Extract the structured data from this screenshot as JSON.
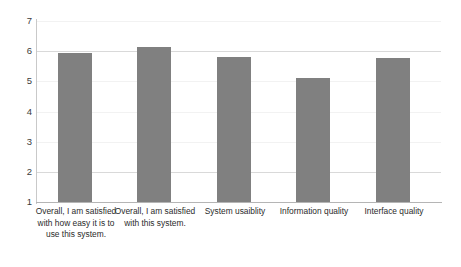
{
  "chart_data": {
    "type": "bar",
    "title": "",
    "subtitle": "",
    "xlabel": "",
    "ylabel": "",
    "ylim": [
      1,
      7
    ],
    "ytick_labels": [
      "7",
      "6",
      "5",
      "4",
      "3",
      "2",
      "1"
    ],
    "ytick_values": [
      7,
      6,
      5,
      4,
      3,
      2,
      1
    ],
    "grid": true,
    "grid_axis": "y",
    "legend": false,
    "bar_color": "#808080",
    "gridline_color": "#d9d9d9",
    "axis_color": "#b5b5b5",
    "categories": [
      "Overall, I am satisfied with how easy it is to use this system.",
      "Overall, I am satisfied with this system.",
      "System usaiblity",
      "Information quality",
      "Interface quality"
    ],
    "values": [
      5.93,
      6.13,
      5.8,
      5.12,
      5.77
    ],
    "series": [
      {
        "name": "",
        "values": [
          5.93,
          6.13,
          5.8,
          5.12,
          5.77
        ]
      }
    ]
  },
  "axes": {
    "y_ticks": [
      {
        "label": "7",
        "value": 7
      },
      {
        "label": "6",
        "value": 6
      },
      {
        "label": "5",
        "value": 5
      },
      {
        "label": "4",
        "value": 4
      },
      {
        "label": "3",
        "value": 3
      },
      {
        "label": "2",
        "value": 2
      },
      {
        "label": "1",
        "value": 1
      }
    ]
  }
}
